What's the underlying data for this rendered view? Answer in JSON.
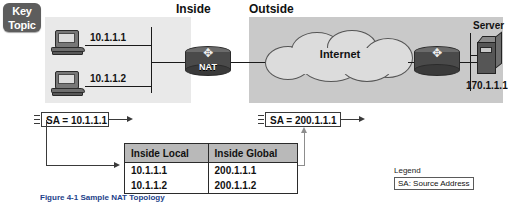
{
  "badge": {
    "line1": "Key",
    "line2": "Topic"
  },
  "zones": {
    "inside_label": "Inside",
    "outside_label": "Outside"
  },
  "hosts": [
    {
      "name": "pc-1",
      "ip": "10.1.1.1"
    },
    {
      "name": "pc-2",
      "ip": "10.1.1.2"
    }
  ],
  "nat_router": {
    "label": "NAT",
    "icon": "router-icon"
  },
  "edge_router": {
    "label": "",
    "icon": "router-icon"
  },
  "cloud": {
    "label": "Internet",
    "icon": "cloud-icon"
  },
  "server": {
    "label": "Server",
    "ip": "170.1.1.1",
    "icon": "server-icon"
  },
  "packets": [
    {
      "name": "packet-inside",
      "text": "SA = 10.1.1.1"
    },
    {
      "name": "packet-outside",
      "text": "SA = 200.1.1.1"
    }
  ],
  "nat_table": {
    "headers": [
      "Inside Local",
      "Inside Global"
    ],
    "rows": [
      [
        "10.1.1.1",
        "200.1.1.1"
      ],
      [
        "10.1.1.2",
        "200.1.1.2"
      ]
    ]
  },
  "legend": {
    "title": "Legend",
    "entry": "SA: Source Address"
  },
  "caption": "Figure 4-1  Sample NAT Topology",
  "colors": {
    "inside_zone": "#e9e9e9",
    "outside_zone": "#c9c9c9",
    "badge": "#5d5d5d",
    "table_header": "#b9b9b9",
    "line": "#3a3a3a",
    "gray_arrow": "#8d8d8d"
  }
}
